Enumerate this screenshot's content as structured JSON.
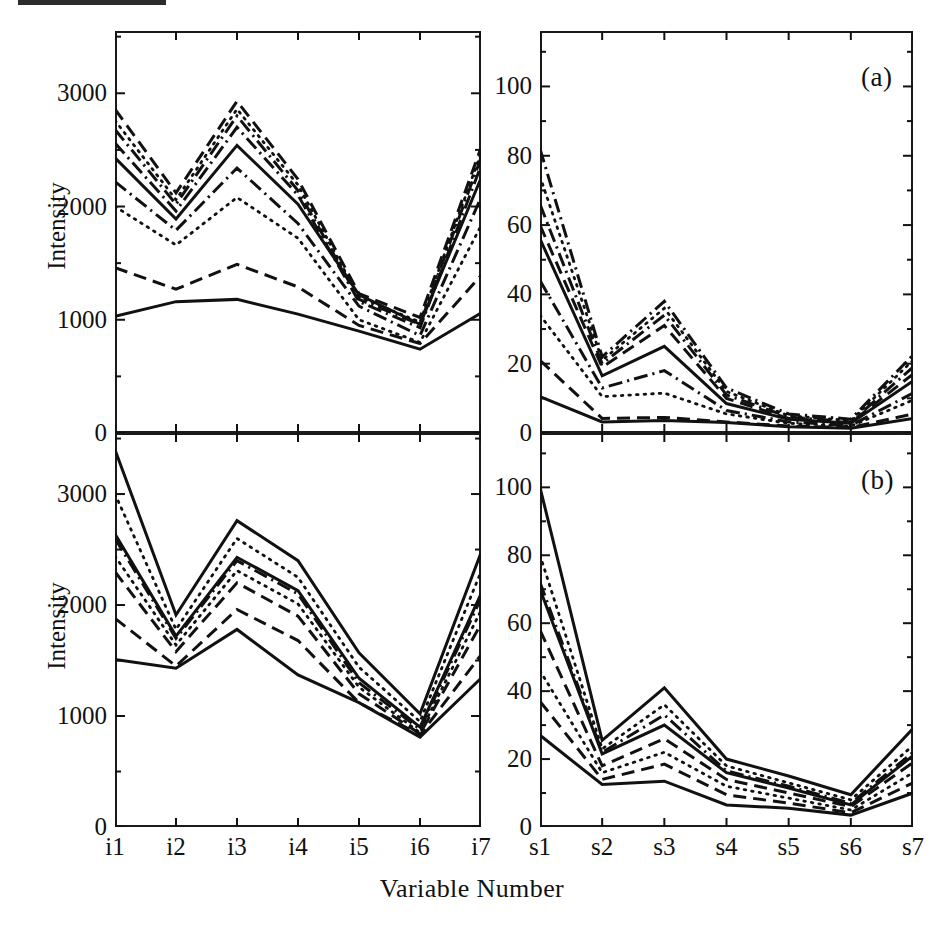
{
  "figure": {
    "axis_title_x": "Variable Number",
    "axis_title_y_top": "Intensity",
    "axis_title_y_bottom": "Intensity",
    "panel_tag_a": "(a)",
    "panel_tag_b": "(b)",
    "caption_partial": "",
    "line_color": "#111111",
    "background": "#ffffff"
  },
  "axes": {
    "i_categories": [
      "i1",
      "i2",
      "i3",
      "i4",
      "i5",
      "i6",
      "i7"
    ],
    "s_categories": [
      "s1",
      "s2",
      "s3",
      "s4",
      "s5",
      "s6",
      "s7"
    ],
    "intensity_ticks": [
      "0",
      "1000",
      "2000",
      "3000"
    ],
    "intensity_tick_values": [
      0,
      1000,
      2000,
      3000
    ],
    "intensity_minor_values": [
      500,
      1500,
      2500,
      3500
    ],
    "intensity_limits": [
      0,
      3550
    ],
    "percent_ticks": [
      "0",
      "20",
      "40",
      "60",
      "80",
      "100"
    ],
    "percent_tick_values": [
      0,
      20,
      40,
      60,
      80,
      100
    ],
    "percent_minor_values": [
      10,
      30,
      50,
      70,
      90,
      110
    ],
    "percent_limits": [
      0,
      116
    ]
  },
  "chart_data": [
    {
      "id": "top-left",
      "type": "line",
      "title": "",
      "xlabel": "Variable Number",
      "ylabel": "Intensity",
      "categories": [
        "i1",
        "i2",
        "i3",
        "i4",
        "i5",
        "i6",
        "i7"
      ],
      "xlim": [
        0,
        6
      ],
      "ylim": [
        0,
        3550
      ],
      "grid": false,
      "legend": "none",
      "series": [
        {
          "name": "line-1",
          "style": "dashed",
          "values": [
            2860,
            2120,
            2930,
            2240,
            1230,
            1020,
            2520
          ]
        },
        {
          "name": "line-2",
          "style": "dotted",
          "values": [
            2760,
            2060,
            2860,
            2190,
            1200,
            980,
            2470
          ]
        },
        {
          "name": "line-3",
          "style": "dashdot",
          "values": [
            2680,
            2020,
            2800,
            2140,
            1180,
            960,
            2430
          ]
        },
        {
          "name": "line-4",
          "style": "dashdot",
          "values": [
            2560,
            1960,
            2700,
            2100,
            1160,
            930,
            2360
          ]
        },
        {
          "name": "line-5",
          "style": "solid",
          "values": [
            2430,
            1890,
            2540,
            2020,
            1220,
            960,
            2250
          ]
        },
        {
          "name": "line-6",
          "style": "dashdot",
          "values": [
            2220,
            1790,
            2340,
            1850,
            1120,
            860,
            2080
          ]
        },
        {
          "name": "line-7",
          "style": "dotted",
          "values": [
            2000,
            1660,
            2080,
            1720,
            1000,
            800,
            1830
          ]
        },
        {
          "name": "line-8",
          "style": "dashed",
          "values": [
            1460,
            1270,
            1490,
            1290,
            950,
            790,
            1390
          ]
        },
        {
          "name": "line-9",
          "style": "solid",
          "values": [
            1030,
            1160,
            1180,
            1050,
            900,
            740,
            1060
          ]
        }
      ]
    },
    {
      "id": "top-right",
      "type": "line",
      "title": "(a)",
      "xlabel": "Variable Number",
      "ylabel": "",
      "categories": [
        "s1",
        "s2",
        "s3",
        "s4",
        "s5",
        "s6",
        "s7"
      ],
      "xlim": [
        0,
        6
      ],
      "ylim": [
        0,
        116
      ],
      "grid": false,
      "legend": "none",
      "series": [
        {
          "name": "line-1",
          "style": "dashdot",
          "values": [
            82,
            22,
            38,
            13,
            5.5,
            4.0,
            22.5
          ]
        },
        {
          "name": "line-2",
          "style": "dotted",
          "values": [
            74,
            21,
            36,
            12,
            5.0,
            3.6,
            21.0
          ]
        },
        {
          "name": "line-3",
          "style": "dashdot",
          "values": [
            66,
            20,
            34,
            11,
            4.6,
            3.2,
            19.0
          ]
        },
        {
          "name": "line-4",
          "style": "dashed",
          "values": [
            60,
            19,
            31,
            10,
            4.2,
            3.0,
            17.0
          ]
        },
        {
          "name": "line-5",
          "style": "solid",
          "values": [
            56,
            16.5,
            25,
            8.5,
            4.0,
            2.8,
            15.0
          ]
        },
        {
          "name": "line-6",
          "style": "dashdot",
          "values": [
            44,
            13,
            18,
            6.5,
            3.2,
            2.2,
            11.5
          ]
        },
        {
          "name": "line-7",
          "style": "dotted",
          "values": [
            34,
            10.5,
            11.5,
            5.5,
            2.8,
            2.0,
            9.5
          ]
        },
        {
          "name": "line-8",
          "style": "dashed",
          "values": [
            21,
            4.2,
            4.5,
            3.2,
            2.0,
            1.6,
            5.5
          ]
        },
        {
          "name": "line-9",
          "style": "solid",
          "values": [
            10.5,
            3.2,
            3.6,
            3.0,
            1.8,
            1.4,
            4.2
          ]
        }
      ]
    },
    {
      "id": "bottom-left",
      "type": "line",
      "title": "",
      "xlabel": "Variable Number",
      "ylabel": "Intensity",
      "categories": [
        "i1",
        "i2",
        "i3",
        "i4",
        "i5",
        "i6",
        "i7"
      ],
      "xlim": [
        0,
        6
      ],
      "ylim": [
        0,
        3550
      ],
      "grid": false,
      "legend": "none",
      "series": [
        {
          "name": "line-1",
          "style": "solid",
          "values": [
            3400,
            1910,
            2760,
            2400,
            1570,
            1020,
            2470
          ]
        },
        {
          "name": "line-2",
          "style": "dotted",
          "values": [
            3000,
            1780,
            2600,
            2250,
            1440,
            950,
            2300
          ]
        },
        {
          "name": "line-3",
          "style": "solid",
          "values": [
            2640,
            1720,
            2430,
            2130,
            1340,
            900,
            2100
          ]
        },
        {
          "name": "line-4",
          "style": "dashdot",
          "values": [
            2600,
            1700,
            2400,
            2100,
            1300,
            880,
            2060
          ]
        },
        {
          "name": "line-5",
          "style": "dotted",
          "values": [
            2440,
            1640,
            2310,
            2010,
            1260,
            850,
            1950
          ]
        },
        {
          "name": "line-6",
          "style": "dashed",
          "values": [
            2300,
            1580,
            2200,
            1900,
            1200,
            840,
            1830
          ]
        },
        {
          "name": "line-7",
          "style": "dashed",
          "values": [
            1880,
            1450,
            1960,
            1680,
            1120,
            830,
            1550
          ]
        },
        {
          "name": "line-8",
          "style": "solid",
          "values": [
            1510,
            1430,
            1780,
            1370,
            1120,
            810,
            1340
          ]
        }
      ]
    },
    {
      "id": "bottom-right",
      "type": "line",
      "title": "(b)",
      "xlabel": "Variable Number",
      "ylabel": "",
      "categories": [
        "s1",
        "s2",
        "s3",
        "s4",
        "s5",
        "s6",
        "s7"
      ],
      "xlim": [
        0,
        6
      ],
      "ylim": [
        0,
        116
      ],
      "grid": false,
      "legend": "none",
      "series": [
        {
          "name": "line-1",
          "style": "solid",
          "values": [
            100,
            25.5,
            41,
            20,
            15,
            9.5,
            29
          ]
        },
        {
          "name": "line-2",
          "style": "dotted",
          "values": [
            80,
            23,
            36,
            18,
            13,
            8.0,
            24
          ]
        },
        {
          "name": "line-3",
          "style": "dashdot",
          "values": [
            72,
            22,
            33,
            16.5,
            12,
            7.0,
            22
          ]
        },
        {
          "name": "line-4",
          "style": "solid",
          "values": [
            70,
            21.5,
            30,
            16,
            11.5,
            6.5,
            21
          ]
        },
        {
          "name": "line-5",
          "style": "dashed",
          "values": [
            58,
            18,
            26,
            14,
            10,
            6.0,
            19
          ]
        },
        {
          "name": "line-6",
          "style": "dotted",
          "values": [
            46,
            16,
            22,
            12,
            8.5,
            5.0,
            16
          ]
        },
        {
          "name": "line-7",
          "style": "dashed",
          "values": [
            37,
            14,
            18.5,
            9.5,
            7.0,
            4.2,
            13
          ]
        },
        {
          "name": "line-8",
          "style": "solid",
          "values": [
            27,
            12.5,
            13.5,
            6.5,
            5.5,
            3.5,
            10
          ]
        }
      ]
    }
  ]
}
